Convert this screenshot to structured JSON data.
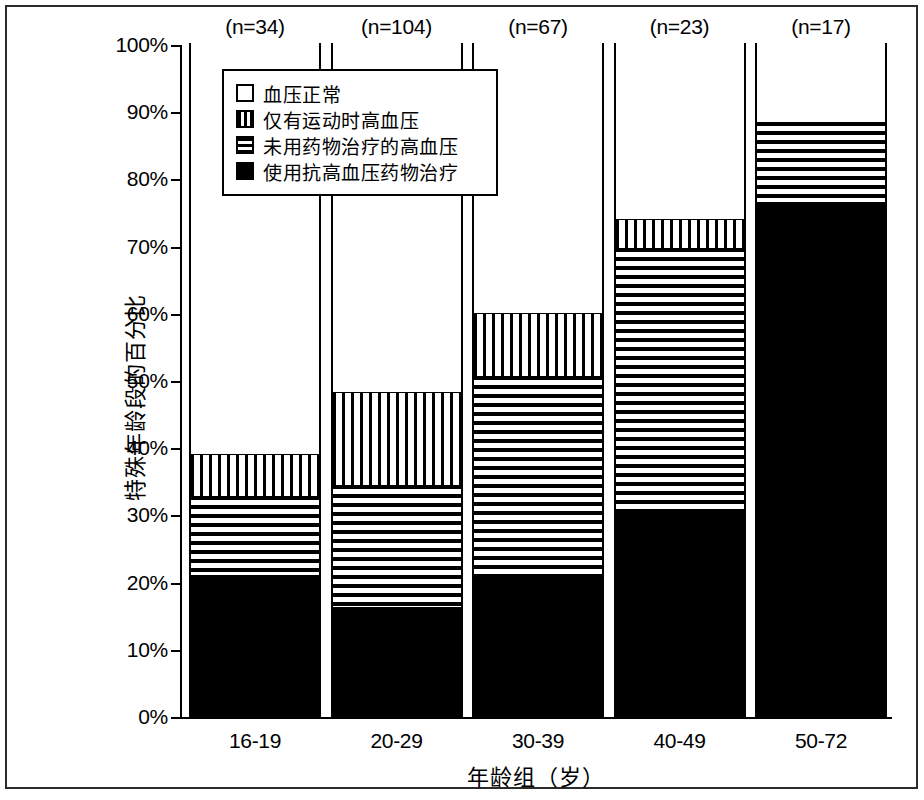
{
  "chart_data": {
    "type": "bar",
    "subtype": "stacked-bar-100-percent",
    "title": "",
    "xlabel": "年龄组（岁）",
    "ylabel": "特殊年龄段的百分比",
    "ylim": [
      0,
      100
    ],
    "grid": false,
    "legend_position": "inside-top-left",
    "categories": [
      "16-19",
      "20-29",
      "30-39",
      "40-49",
      "50-72"
    ],
    "group_sizes": [
      "(n=34)",
      "(n=104)",
      "(n=67)",
      "(n=23)",
      "(n=17)"
    ],
    "ytick_labels": [
      "100%",
      "90%",
      "80%",
      "70%",
      "60%",
      "50%",
      "40%",
      "30%",
      "20%",
      "10%",
      "0%"
    ],
    "ytick_values": [
      100,
      90,
      80,
      70,
      60,
      50,
      40,
      30,
      20,
      10,
      0
    ],
    "series": [
      {
        "name": "使用抗高血压药物治疗",
        "pattern": "solid-black",
        "color": "#000000",
        "values": [
          20.9,
          16.0,
          21.0,
          30.3,
          76.3
        ]
      },
      {
        "name": "未用药物治疗的高血压",
        "pattern": "horizontal-lines",
        "color": "#000000",
        "values": [
          11.7,
          18.3,
          29.5,
          39.2,
          11.9
        ]
      },
      {
        "name": "仅有运动时高血压",
        "pattern": "vertical-lines",
        "color": "#000000",
        "values": [
          6.2,
          13.7,
          9.3,
          4.3,
          0.0
        ]
      },
      {
        "name": "血压正常",
        "pattern": "white",
        "color": "#ffffff",
        "values": [
          61.2,
          52.0,
          40.2,
          26.2,
          11.8
        ]
      }
    ],
    "cumulative_tops": {
      "使用抗高血压药物治疗": [
        20.9,
        16.0,
        21.0,
        30.3,
        76.3
      ],
      "未用药物治疗的高血压": [
        32.6,
        34.3,
        50.5,
        69.5,
        88.2
      ],
      "仅有运动时高血压": [
        38.8,
        48.0,
        59.8,
        73.8,
        88.2
      ],
      "血压正常": [
        100,
        100,
        100,
        100,
        100
      ]
    }
  },
  "legend": {
    "items": [
      {
        "label": "血压正常",
        "pattern": "white"
      },
      {
        "label": "仅有运动时高血压",
        "pattern": "vert"
      },
      {
        "label": "未用药物治疗的高血压",
        "pattern": "horiz"
      },
      {
        "label": "使用抗高血压药物治疗",
        "pattern": "black"
      }
    ]
  }
}
